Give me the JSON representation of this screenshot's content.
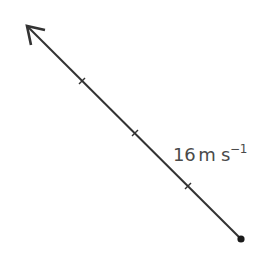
{
  "diagram": {
    "type": "velocity-vector",
    "vector": {
      "start": {
        "x": 241,
        "y": 239
      },
      "tip": {
        "x": 26,
        "y": 25
      },
      "direction": "up-left",
      "tick_marks": [
        {
          "x": 82,
          "y": 81
        },
        {
          "x": 135,
          "y": 133
        },
        {
          "x": 188,
          "y": 186
        }
      ],
      "color": "#333333"
    },
    "label": {
      "magnitude": "16",
      "unit": "m s",
      "exponent": "−1"
    }
  }
}
